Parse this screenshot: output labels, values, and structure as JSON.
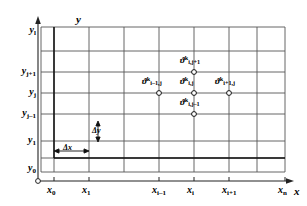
{
  "figure": {
    "type": "finite-difference-grid-diagram",
    "axes": {
      "x_axis_label": "x",
      "y_axis_label": "y",
      "origin_marker": "open-circle"
    },
    "x_ticks": [
      {
        "id": "x0",
        "base": "x",
        "sub": "0",
        "pos": 54
      },
      {
        "id": "x1",
        "base": "x",
        "sub": "1",
        "pos": 89
      },
      {
        "id": "xim1",
        "base": "x",
        "sub": "i–1",
        "pos": 159
      },
      {
        "id": "xi",
        "base": "x",
        "sub": "i",
        "pos": 194
      },
      {
        "id": "xip1",
        "base": "x",
        "sub": "i+1",
        "pos": 229
      },
      {
        "id": "xn",
        "base": "x",
        "sub": "n",
        "pos": 285
      }
    ],
    "y_ticks": [
      {
        "id": "yl",
        "base": "y",
        "sub": "l",
        "pos": 31
      },
      {
        "id": "yjp1",
        "base": "y",
        "sub": "j+1",
        "pos": 72
      },
      {
        "id": "yj",
        "base": "y",
        "sub": "j",
        "pos": 93
      },
      {
        "id": "yjm1",
        "base": "y",
        "sub": "j–1",
        "pos": 114
      },
      {
        "id": "y1",
        "base": "y",
        "sub": "1",
        "pos": 141
      },
      {
        "id": "y0",
        "base": "y",
        "sub": "0",
        "pos": 169
      }
    ],
    "nodes": [
      {
        "id": "node-i-jp1",
        "base": "ϑ",
        "sup": "k",
        "sub": "i,j+1",
        "x": 194,
        "y": 72,
        "lx": 180,
        "ly": 55
      },
      {
        "id": "node-im1-j",
        "base": "ϑ",
        "sup": "k",
        "sub": "i–1,j",
        "x": 159,
        "y": 93,
        "lx": 142,
        "ly": 76
      },
      {
        "id": "node-i-j",
        "base": "ϑ",
        "sup": "k",
        "sub": "i,j",
        "x": 194,
        "y": 93,
        "lx": 180,
        "ly": 76
      },
      {
        "id": "node-ip1-j",
        "base": "ϑ",
        "sup": "k",
        "sub": "i+1,j",
        "x": 229,
        "y": 93,
        "lx": 215,
        "ly": 76
      },
      {
        "id": "node-i-jm1",
        "base": "ϑ",
        "sup": "k",
        "sub": "i,j–1",
        "x": 194,
        "y": 114,
        "lx": 180,
        "ly": 97
      }
    ],
    "annotations": {
      "delta_x_label": "Δx",
      "delta_y_label": "Δy"
    },
    "colors": {
      "grid_line": "#555555",
      "boundary_line": "#111111",
      "axis_line": "#222222",
      "node_fill": "#ffffff",
      "background": "#ffffff"
    }
  }
}
